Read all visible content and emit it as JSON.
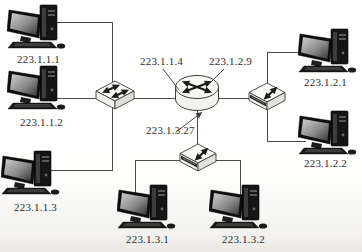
{
  "diagram": {
    "router": {
      "interfaces": [
        "223.1.1.4",
        "223.1.2.9",
        "223.1.3.27"
      ]
    },
    "subnets": [
      {
        "device": "switch",
        "router_interface": "223.1.1.4",
        "hosts": [
          "223.1.1.1",
          "223.1.1.2",
          "223.1.1.3"
        ]
      },
      {
        "device": "hub",
        "router_interface": "223.1.2.9",
        "hosts": [
          "223.1.2.1",
          "223.1.2.2"
        ]
      },
      {
        "device": "hub",
        "router_interface": "223.1.3.27",
        "hosts": [
          "223.1.3.1",
          "223.1.3.2"
        ]
      }
    ],
    "colors": {
      "line": "#4a4a4a",
      "text": "#2e2e2e",
      "device_fill": "#f7f7f4",
      "pc_fill": "#161616"
    }
  }
}
